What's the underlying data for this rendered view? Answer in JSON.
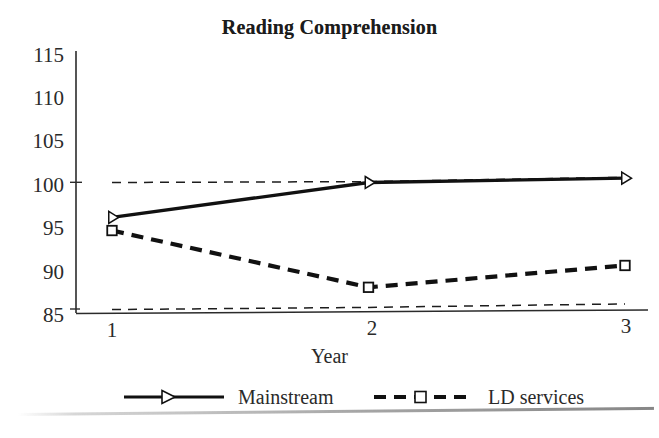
{
  "chart_data": {
    "type": "line",
    "title": "Reading Comprehension",
    "xlabel": "Year",
    "ylabel": "",
    "categories": [
      "1",
      "2",
      "3"
    ],
    "x": [
      1,
      2,
      3
    ],
    "xlim": [
      0.88,
      3.05
    ],
    "ylim": [
      85,
      115
    ],
    "yticks": [
      85,
      90,
      95,
      100,
      105,
      110,
      115
    ],
    "xticks": [
      "1",
      "2",
      "3"
    ],
    "grid": false,
    "legend_position": "bottom",
    "series": [
      {
        "name": "Mainstream",
        "values": [
          96,
          100,
          100.5
        ],
        "line_style": "solid",
        "marker": "triangle-right",
        "color": "#111111"
      },
      {
        "name": "LD services",
        "values": [
          94.5,
          88,
          90.5
        ],
        "line_style": "dashed",
        "marker": "square",
        "color": "#111111"
      }
    ],
    "reference_lines": [
      {
        "name": "upper-reference",
        "values": [
          100,
          100.1,
          100.6
        ],
        "line_style": "dashed"
      },
      {
        "name": "lower-reference",
        "values": [
          85.45,
          85.7,
          86.1
        ],
        "line_style": "dashed"
      }
    ]
  },
  "axis": {
    "ytick_labels": [
      "115",
      "110",
      "105",
      "100",
      "95",
      "90",
      "85"
    ],
    "xtick_labels": [
      "1",
      "2",
      "3"
    ],
    "x_axis_title": "Year"
  },
  "legend": {
    "items": [
      {
        "label": "Mainstream",
        "marker": "triangle-right-icon",
        "line": "solid"
      },
      {
        "label": "LD services",
        "marker": "square-icon",
        "line": "dashed"
      }
    ]
  },
  "colors": {
    "ink": "#111111",
    "text": "#2a2a2a",
    "background": "#ffffff"
  }
}
